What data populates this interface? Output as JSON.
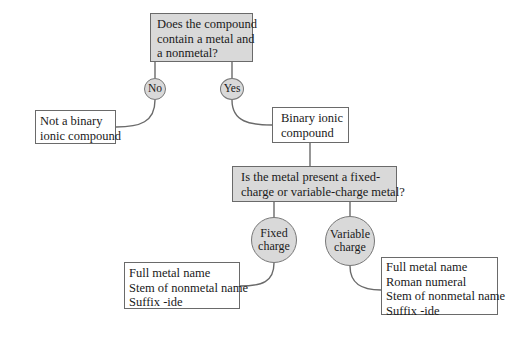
{
  "diagram": {
    "question1": {
      "lines": [
        "Does the compound",
        "contain a metal and",
        "a nonmetal?"
      ]
    },
    "branch_no": {
      "label": "No"
    },
    "branch_yes": {
      "label": "Yes"
    },
    "not_binary": {
      "lines": [
        "Not a binary",
        "ionic compound"
      ]
    },
    "binary_ionic": {
      "lines": [
        "Binary ionic",
        "compound"
      ]
    },
    "question2": {
      "lines": [
        "Is the metal present a fixed-",
        "charge or variable-charge metal?"
      ]
    },
    "branch_fixed": {
      "lines": [
        "Fixed",
        "charge"
      ]
    },
    "branch_variable": {
      "lines": [
        "Variable",
        "charge"
      ]
    },
    "fixed_result": {
      "lines": [
        "Full metal name",
        "Stem of nonmetal name",
        "Suffix -ide"
      ]
    },
    "variable_result": {
      "lines": [
        "Full metal name",
        "Roman numeral",
        "Stem of nonmetal name",
        "Suffix -ide"
      ]
    },
    "colors": {
      "decision_fill": "#d9d9d9",
      "box_border": "#6a6a6a",
      "connector": "#6a6a6a"
    }
  }
}
